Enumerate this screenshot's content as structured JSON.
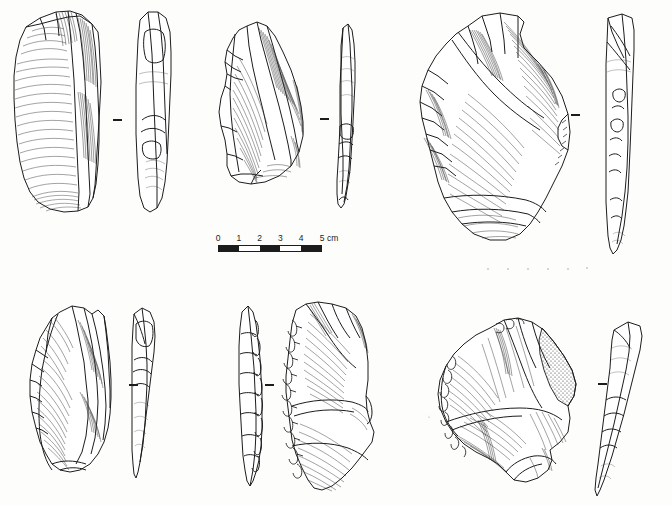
{
  "plate": {
    "title": "Lithic artifact illustration plate",
    "description": "Line drawings of six knapped stone artifacts, each shown in main face view and profile view",
    "background_color": "#fdfdfc",
    "ink_color": "#1c1c1c",
    "width": 672,
    "height": 506
  },
  "scale_bar": {
    "name": "scale-bar",
    "unit": "cm",
    "labels": [
      "0",
      "1",
      "2",
      "3",
      "4",
      "5"
    ],
    "unit_label": "cm",
    "segments": [
      "dark",
      "light",
      "dark",
      "light",
      "dark"
    ],
    "min": 0,
    "max": 5,
    "x": 218,
    "y": 233,
    "length_px": 104
  },
  "artifacts": [
    {
      "id": 1,
      "name": "artifact-1",
      "position": "top-left",
      "main_view": "dorsal",
      "profile_side": "right",
      "has_cortex": false,
      "has_retouch": false,
      "separator": {
        "x": 113,
        "y": 119
      }
    },
    {
      "id": 2,
      "name": "artifact-2",
      "position": "top-center",
      "main_view": "dorsal",
      "profile_side": "right",
      "has_cortex": false,
      "has_retouch": false,
      "separator": {
        "x": 320,
        "y": 118
      }
    },
    {
      "id": 3,
      "name": "artifact-3",
      "position": "top-right",
      "main_view": "dorsal",
      "profile_side": "right",
      "has_cortex": false,
      "has_retouch": true,
      "separator": {
        "x": 571,
        "y": 114
      }
    },
    {
      "id": 4,
      "name": "artifact-4",
      "position": "bottom-left",
      "main_view": "dorsal",
      "profile_side": "right",
      "has_cortex": false,
      "has_retouch": false,
      "separator": {
        "x": 129,
        "y": 384
      }
    },
    {
      "id": 5,
      "name": "artifact-5",
      "position": "bottom-center",
      "main_view": "dorsal",
      "profile_side": "left",
      "has_cortex": false,
      "has_retouch": true,
      "separator": {
        "x": 265,
        "y": 384
      }
    },
    {
      "id": 6,
      "name": "artifact-6",
      "position": "bottom-right",
      "main_view": "dorsal",
      "profile_side": "right",
      "has_cortex": true,
      "has_retouch": true,
      "separator": {
        "x": 598,
        "y": 383
      }
    }
  ]
}
